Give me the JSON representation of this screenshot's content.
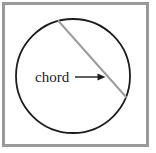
{
  "figure": {
    "label": "chord",
    "colors": {
      "background": "#ffffff",
      "frame": "#9a9a9a",
      "circle_stroke": "#1d1d1d",
      "chord_stroke": "#9c9c9c",
      "arrow": "#1d1d1d",
      "label_text": "#1d1d1d"
    }
  }
}
